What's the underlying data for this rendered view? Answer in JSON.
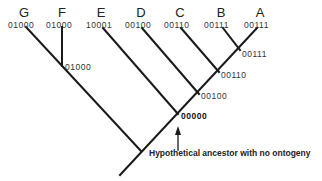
{
  "diagram": {
    "type": "cladogram",
    "taxa": [
      {
        "label": "G",
        "code": "01000"
      },
      {
        "label": "F",
        "code": "01000"
      },
      {
        "label": "E",
        "code": "10001"
      },
      {
        "label": "D",
        "code": "00100"
      },
      {
        "label": "C",
        "code": "00110"
      },
      {
        "label": "B",
        "code": "00111"
      },
      {
        "label": "A",
        "code": "00111"
      }
    ],
    "nodes": [
      {
        "id": "GF",
        "code": "01000"
      },
      {
        "id": "AB",
        "code": "00111"
      },
      {
        "id": "ABC",
        "code": "00110"
      },
      {
        "id": "ABCD",
        "code": "00100"
      },
      {
        "id": "ancestor",
        "code": "00000"
      }
    ],
    "annotation": "Hypothetical ancestor with no ontogeny",
    "colors": {
      "line": "#1a1a1a",
      "background": "#ffffff"
    }
  }
}
